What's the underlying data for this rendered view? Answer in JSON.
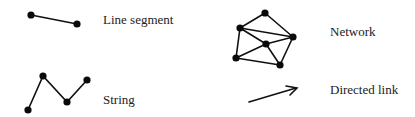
{
  "diagram": {
    "type": "legend-of-spatial-primitives",
    "items": [
      {
        "id": "line_segment",
        "label": "Line segment"
      },
      {
        "id": "string",
        "label": "String"
      },
      {
        "id": "network",
        "label": "Network"
      },
      {
        "id": "directed_link",
        "label": "Directed link"
      }
    ],
    "colors": {
      "stroke": "#111111",
      "node": "#0a0a0a",
      "text": "#222222",
      "background": "#ffffff"
    }
  }
}
